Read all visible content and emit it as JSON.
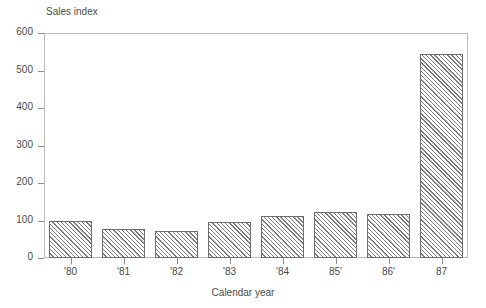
{
  "chart_data": {
    "type": "bar",
    "title": "",
    "xlabel": "Calendar year",
    "ylabel": "Sales index",
    "categories": [
      "'80",
      "'81",
      "'82",
      "'83",
      "'84",
      "85'",
      "86'",
      "87"
    ],
    "values": [
      100,
      77,
      72,
      95,
      112,
      123,
      118,
      545
    ],
    "ylim": [
      0,
      600
    ],
    "yticks": [
      0,
      100,
      200,
      300,
      400,
      500,
      600
    ],
    "ytick_labels": [
      "0",
      "100",
      "200",
      "300",
      "400",
      "500",
      "600"
    ],
    "grid": false,
    "legend": false,
    "legend_position": "none",
    "bar_fill": "diagonal-hatch",
    "bar_edge_color": "#6e6e6e",
    "frame_color": "#b9b9b9",
    "text_color": "#4a4a4a"
  }
}
